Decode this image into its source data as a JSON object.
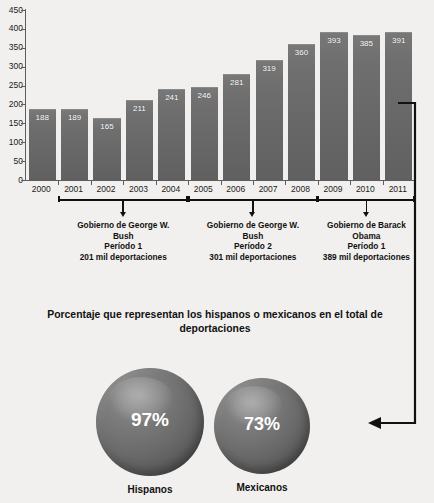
{
  "top_partial_title": "",
  "chart_data": {
    "type": "bar",
    "title": "",
    "xlabel": "",
    "ylabel": "",
    "ylim": [
      0,
      450
    ],
    "ytick_step": 50,
    "yticks": [
      "450",
      "400",
      "350",
      "300",
      "250",
      "200",
      "150",
      "100",
      "50",
      "0"
    ],
    "grid": false,
    "legend": "none",
    "categories": [
      "2000",
      "2001",
      "2002",
      "2003",
      "2004",
      "2005",
      "2006",
      "2007",
      "2008",
      "2009",
      "2010",
      "2011"
    ],
    "values": [
      188,
      189,
      165,
      211,
      241,
      246,
      281,
      319,
      360,
      393,
      385,
      391
    ],
    "bar_labels": [
      "188",
      "189",
      "165",
      "211",
      "241",
      "246",
      "281",
      "319",
      "360",
      "393",
      "385",
      "391"
    ],
    "series": [
      {
        "name": "Deportaciones (miles)",
        "values": [
          188,
          189,
          165,
          211,
          241,
          246,
          281,
          319,
          360,
          393,
          385,
          391
        ]
      }
    ],
    "annotations": [
      {
        "span_start": "2001",
        "span_end": "2004",
        "line1": "Gobierno de George W.",
        "line2": "Bush",
        "line3": "Período 1",
        "line4": "201 mil deportaciones"
      },
      {
        "span_start": "2005",
        "span_end": "2008",
        "line1": "Gobierno de George W.",
        "line2": "Bush",
        "line3": "Período 2",
        "line4": "301 mil deportaciones"
      },
      {
        "span_start": "2009",
        "span_end": "2011",
        "line1": "Gobierno de Barack",
        "line2": "Obama",
        "line3": "Período 1",
        "line4": "389 mil deportaciones"
      }
    ],
    "colors": {
      "bar": "#6a6a6a",
      "bar_label": "#ffffff",
      "axis": "#5d5d5d",
      "text": "#1b1b1b",
      "background": "#f1f0ee"
    }
  },
  "bottom": {
    "title": "Porcentaje que representan los hispanos o mexicanos en el total de deportaciones",
    "spheres": [
      {
        "value": "97%",
        "label": "Hispanos"
      },
      {
        "value": "73%",
        "label": "Mexicanos"
      }
    ],
    "sphere_color": "#6c6c6c"
  }
}
